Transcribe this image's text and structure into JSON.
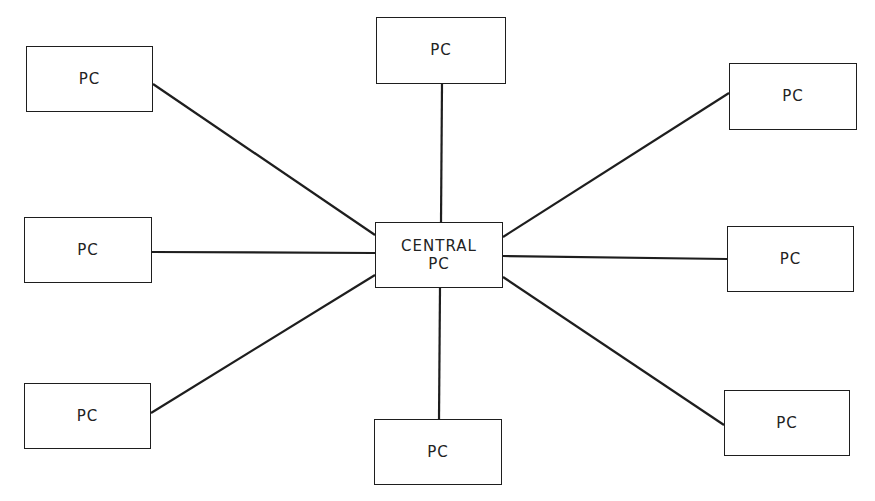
{
  "diagram": {
    "type": "star-network-topology",
    "line_color": "#1e1e1e",
    "background": "#ffffff",
    "central": {
      "label": "CENTRAL\nPC",
      "x": 375,
      "y": 222,
      "w": 128,
      "h": 66
    },
    "nodes": [
      {
        "id": "top-left",
        "label": "PC",
        "x": 26,
        "y": 46,
        "w": 127,
        "h": 66,
        "edge": [
          153,
          84,
          375,
          235
        ]
      },
      {
        "id": "top",
        "label": "PC",
        "x": 376,
        "y": 17,
        "w": 130,
        "h": 67,
        "edge": [
          442,
          84,
          441,
          222
        ]
      },
      {
        "id": "top-right",
        "label": "PC",
        "x": 729,
        "y": 63,
        "w": 128,
        "h": 67,
        "edge": [
          729,
          93,
          503,
          237
        ]
      },
      {
        "id": "middle-left",
        "label": "PC",
        "x": 24,
        "y": 217,
        "w": 128,
        "h": 66,
        "edge": [
          152,
          252,
          375,
          253
        ]
      },
      {
        "id": "middle-right",
        "label": "PC",
        "x": 727,
        "y": 226,
        "w": 127,
        "h": 66,
        "edge": [
          503,
          256,
          727,
          259
        ]
      },
      {
        "id": "bottom-left",
        "label": "PC",
        "x": 24,
        "y": 383,
        "w": 127,
        "h": 66,
        "edge": [
          151,
          413,
          375,
          275
        ]
      },
      {
        "id": "bottom",
        "label": "PC",
        "x": 374,
        "y": 419,
        "w": 128,
        "h": 66,
        "edge": [
          440,
          288,
          439,
          419
        ]
      },
      {
        "id": "bottom-right",
        "label": "PC",
        "x": 724,
        "y": 390,
        "w": 126,
        "h": 66,
        "edge": [
          503,
          277,
          724,
          425
        ]
      }
    ]
  }
}
